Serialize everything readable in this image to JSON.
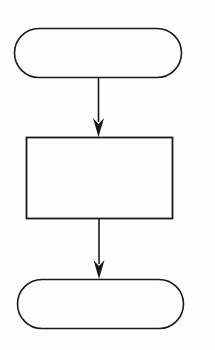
{
  "diagram": {
    "type": "flowchart",
    "stroke_color": "#1a1a1a",
    "background": "#fdfdfd",
    "nodes": [
      {
        "id": "start",
        "shape": "terminator",
        "label": "",
        "x": 14,
        "y": 28,
        "w": 167,
        "h": 49
      },
      {
        "id": "process",
        "shape": "rectangle",
        "label": "",
        "x": 26,
        "y": 137,
        "w": 146,
        "h": 82
      },
      {
        "id": "end",
        "shape": "terminator",
        "label": "",
        "x": 17,
        "y": 279,
        "w": 166,
        "h": 49
      }
    ],
    "edges": [
      {
        "from": "start",
        "to": "process",
        "x": 98,
        "y1": 77,
        "y2": 137
      },
      {
        "from": "process",
        "to": "end",
        "x": 99,
        "y1": 219,
        "y2": 279
      }
    ]
  }
}
